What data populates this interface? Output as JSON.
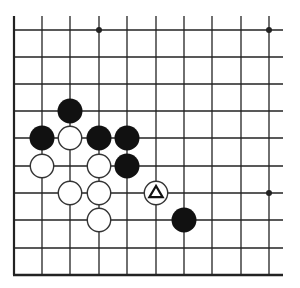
{
  "diagram": {
    "type": "go-board-fragment",
    "columns": 10,
    "rows": 10,
    "edges": [
      "left",
      "bottom"
    ],
    "grid": {
      "x": [
        14,
        42,
        70,
        99,
        127,
        156,
        184,
        212,
        241,
        269
      ],
      "y": [
        30,
        57,
        84,
        111,
        138,
        166,
        193,
        220,
        248,
        275
      ],
      "line_color": "#222222",
      "background": "#ffffff"
    },
    "hoshi": [
      {
        "col": 3,
        "row": 0
      },
      {
        "col": 9,
        "row": 0
      },
      {
        "col": 9,
        "row": 6
      }
    ],
    "stones": [
      {
        "color": "black",
        "col": 2,
        "row": 3
      },
      {
        "color": "black",
        "col": 1,
        "row": 4
      },
      {
        "color": "white",
        "col": 2,
        "row": 4
      },
      {
        "color": "black",
        "col": 3,
        "row": 4
      },
      {
        "color": "black",
        "col": 4,
        "row": 4
      },
      {
        "color": "white",
        "col": 1,
        "row": 5
      },
      {
        "color": "white",
        "col": 3,
        "row": 5
      },
      {
        "color": "black",
        "col": 4,
        "row": 5
      },
      {
        "color": "white",
        "col": 2,
        "row": 6
      },
      {
        "color": "white",
        "col": 3,
        "row": 6
      },
      {
        "color": "white",
        "col": 5,
        "row": 6,
        "marker": "triangle"
      },
      {
        "color": "white",
        "col": 3,
        "row": 7
      },
      {
        "color": "black",
        "col": 6,
        "row": 7
      }
    ],
    "stone_radius": 12
  }
}
